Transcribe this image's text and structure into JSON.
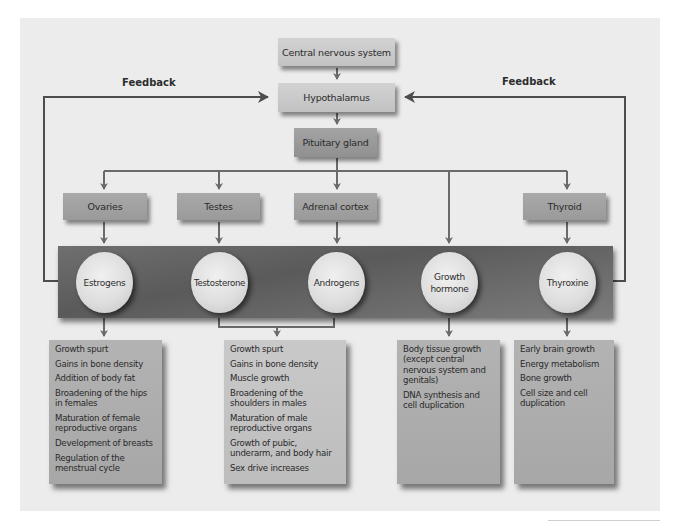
{
  "diagram": {
    "top": {
      "cns": "Central nervous system",
      "hypothalamus": "Hypothalamus",
      "pituitary": "Pituitary gland"
    },
    "feedback": {
      "left": "Feedback",
      "right": "Feedback"
    },
    "glands": [
      {
        "label": "Ovaries"
      },
      {
        "label": "Testes"
      },
      {
        "label": "Adrenal cortex"
      },
      {
        "label": "Thyroid"
      }
    ],
    "hormones": [
      {
        "label": "Estrogens"
      },
      {
        "label": "Testosterone"
      },
      {
        "label": "Androgens"
      },
      {
        "label": "Growth hormone"
      },
      {
        "label": "Thyroxine"
      }
    ],
    "effects": [
      {
        "source": "Estrogens",
        "items": [
          "Growth spurt",
          "Gains in bone density",
          "Addition of body fat",
          "Broadening of the hips in females",
          "Maturation of female reproductive organs",
          "Development of breasts",
          "Regulation of the menstrual cycle"
        ]
      },
      {
        "source": "Testosterone + Androgens",
        "items": [
          "Growth spurt",
          "Gains in bone density",
          "Muscle growth",
          "Broadening of the shoulders in males",
          "Maturation of male reproductive organs",
          "Growth of pubic, underarm, and body hair",
          "Sex drive increases"
        ]
      },
      {
        "source": "Growth hormone",
        "items": [
          "Body tissue growth (except central nervous system and genitals)",
          "DNA synthesis and cell duplication"
        ]
      },
      {
        "source": "Thyroxine",
        "items": [
          "Early brain growth",
          "Energy metabolism",
          "Bone growth",
          "Cell size and cell duplication"
        ]
      }
    ],
    "colors": {
      "background": "#ececec",
      "line": "#6a6a6a",
      "feedback_line": "#505050",
      "band": "#5f5f5f",
      "box_light": "#c8c8c8",
      "box_mid": "#a0a0a0"
    }
  }
}
